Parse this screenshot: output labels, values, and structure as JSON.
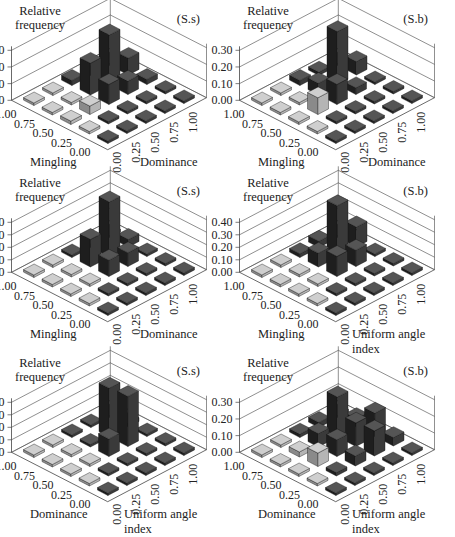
{
  "figure": {
    "y_label_line1": "Relative",
    "y_label_line2": "frequency",
    "grid_ticks": [
      "0.00",
      "0.25",
      "0.50",
      "0.75",
      "1.00"
    ]
  },
  "chart_data": [
    {
      "type": "bar3d",
      "tag": "(S.s)",
      "ylabel": "Relative frequency",
      "left_axis": "Mingling",
      "right_axis": "Dominance",
      "zticks": [
        "0.00",
        "0.10",
        "0.20",
        "0.30"
      ],
      "zmax": 0.3,
      "rows_desc": "rows indexed by left-axis value 0.00..1.00, columns by right-axis value 0.00..1.00",
      "values": [
        [
          0.0,
          0.0,
          0.0,
          0.0,
          0.0
        ],
        [
          0.0,
          0.0,
          0.01,
          0.01,
          0.0
        ],
        [
          0.02,
          0.05,
          0.12,
          0.08,
          0.03
        ],
        [
          0.0,
          0.01,
          0.19,
          0.3,
          0.1
        ],
        [
          0.0,
          0.0,
          0.03,
          0.06,
          0.01
        ]
      ]
    },
    {
      "type": "bar3d",
      "tag": "(S.b)",
      "ylabel": "Relative frequency",
      "left_axis": "Mingling",
      "right_axis": "Dominance",
      "zticks": [
        "0.00",
        "0.10",
        "0.20",
        "0.30"
      ],
      "zmax": 0.3,
      "values": [
        [
          0.0,
          0.0,
          0.0,
          0.0,
          0.0
        ],
        [
          0.0,
          0.0,
          0.0,
          0.0,
          0.0
        ],
        [
          0.0,
          0.1,
          0.12,
          0.04,
          0.0
        ],
        [
          0.0,
          0.0,
          0.07,
          0.32,
          0.08
        ],
        [
          0.0,
          0.0,
          0.03,
          0.02,
          0.0
        ]
      ]
    },
    {
      "type": "bar3d",
      "tag": "(S.s)",
      "ylabel": "Relative frequency",
      "left_axis": "Mingling",
      "right_axis": "Dominance",
      "zticks": [
        "0.00",
        "0.10",
        "0.20",
        "0.30",
        "0.40"
      ],
      "zmax": 0.4,
      "values": [
        [
          0.0,
          0.0,
          0.0,
          0.0,
          0.0
        ],
        [
          0.0,
          0.0,
          0.0,
          0.02,
          0.0
        ],
        [
          0.0,
          0.02,
          0.13,
          0.11,
          0.0
        ],
        [
          0.0,
          0.0,
          0.22,
          0.44,
          0.06
        ],
        [
          0.0,
          0.0,
          0.02,
          0.03,
          0.0
        ]
      ]
    },
    {
      "type": "bar3d",
      "tag": "(S.b)",
      "ylabel": "Relative frequency",
      "left_axis": "Mingling",
      "right_axis": "Uniform angle index",
      "zticks": [
        "0.00",
        "0.10",
        "0.20",
        "0.30",
        "0.40"
      ],
      "zmax": 0.4,
      "values": [
        [
          0.0,
          0.0,
          0.0,
          0.0,
          0.0
        ],
        [
          0.0,
          0.0,
          0.0,
          0.0,
          0.0
        ],
        [
          0.0,
          0.01,
          0.16,
          0.13,
          0.0
        ],
        [
          0.0,
          0.0,
          0.11,
          0.41,
          0.16
        ],
        [
          0.0,
          0.0,
          0.03,
          0.05,
          0.0
        ]
      ]
    },
    {
      "type": "bar3d",
      "tag": "(S.s)",
      "ylabel": "Relative frequency",
      "left_axis": "Dominance",
      "right_axis": "Uniform angle index",
      "zticks": [
        "0.00",
        "0.10",
        "0.20",
        "0.30",
        "0.40"
      ],
      "zmax": 0.4,
      "values": [
        [
          0.0,
          0.0,
          0.0,
          0.0,
          0.0
        ],
        [
          0.0,
          0.0,
          0.02,
          0.0,
          0.0
        ],
        [
          0.0,
          0.01,
          0.14,
          0.4,
          0.02
        ],
        [
          0.0,
          0.0,
          0.02,
          0.39,
          0.03
        ],
        [
          0.0,
          0.0,
          0.01,
          0.0,
          0.0
        ]
      ]
    },
    {
      "type": "bar3d",
      "tag": "(S.b)",
      "ylabel": "Relative frequency",
      "left_axis": "Dominance",
      "right_axis": "Uniform angle index",
      "zticks": [
        "0.00",
        "0.10",
        "0.20",
        "0.30"
      ],
      "zmax": 0.3,
      "values": [
        [
          0.0,
          0.0,
          0.0,
          0.0,
          0.0
        ],
        [
          0.0,
          0.02,
          0.06,
          0.15,
          0.05
        ],
        [
          0.0,
          0.08,
          0.1,
          0.14,
          0.14
        ],
        [
          0.0,
          0.03,
          0.08,
          0.24,
          0.05
        ],
        [
          0.0,
          0.0,
          0.02,
          0.03,
          0.0
        ]
      ]
    }
  ]
}
